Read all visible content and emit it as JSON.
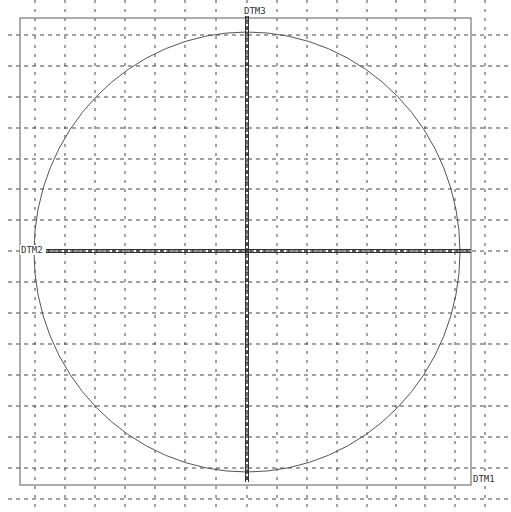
{
  "view": {
    "background": "#ffffff",
    "grid_color": "#444444",
    "frame_color": "#777777",
    "sketch_color": "#555555"
  },
  "grid": {
    "vertical_x": [
      35,
      65,
      95,
      125,
      155,
      185,
      216,
      247,
      277,
      307,
      337,
      367,
      396,
      425,
      455,
      485
    ],
    "horizontal_y": [
      35,
      66,
      97,
      128,
      159,
      189,
      220,
      251,
      282,
      313,
      344,
      375,
      406,
      437,
      468,
      499
    ]
  },
  "frame": {
    "left": 20,
    "top": 18,
    "right": 471,
    "bottom": 485
  },
  "circle": {
    "cx": 247,
    "cy": 252,
    "rx": 213,
    "ry": 220
  },
  "datums": [
    {
      "name": "DTM3",
      "label": "DTM3",
      "orientation": "vertical",
      "x": 247,
      "y1": 8,
      "y2": 482
    },
    {
      "name": "DTM2",
      "label": "DTM2",
      "orientation": "horizontal",
      "y": 251,
      "x1": 46,
      "x2": 471
    },
    {
      "name": "DTM1",
      "label": "DTM1",
      "orientation": "frame-corner",
      "x": 471,
      "y": 478
    }
  ],
  "labels": {
    "dtm3": "DTM3",
    "dtm2": "DTM2",
    "dtm1": "DTM1"
  }
}
